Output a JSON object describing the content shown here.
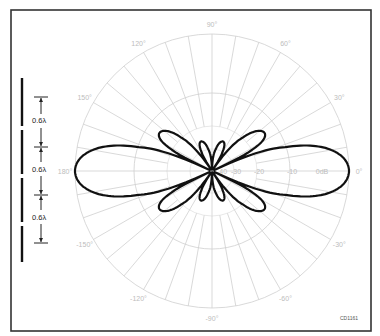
{
  "figure": {
    "code": "CD1161"
  },
  "array": {
    "element_count": 4,
    "spacing_labels": [
      "0.6λ",
      "0.6λ",
      "0.6λ"
    ]
  },
  "polar_grid": {
    "angle_labels": [
      {
        "angle": 90,
        "text": "90°"
      },
      {
        "angle": 60,
        "text": "60°"
      },
      {
        "angle": 30,
        "text": "30°"
      },
      {
        "angle": 0,
        "text": "0°"
      },
      {
        "angle": -30,
        "text": "-30°"
      },
      {
        "angle": -60,
        "text": "-60°"
      },
      {
        "angle": -90,
        "text": "-90°"
      },
      {
        "angle": -120,
        "text": "-120°"
      },
      {
        "angle": -150,
        "text": "-150°"
      },
      {
        "angle": 180,
        "text": "180°"
      },
      {
        "angle": 150,
        "text": "150°"
      },
      {
        "angle": 120,
        "text": "120°"
      }
    ],
    "db_labels": [
      "-40",
      "-30",
      "-20",
      "-10",
      "0dB"
    ],
    "radial_spacing_deg": 10,
    "ring_colors": "#cfcfcf"
  },
  "chart_data": {
    "type": "polar",
    "title": "",
    "radial_unit": "dB",
    "radial_ticks": [
      -40,
      -30,
      -20,
      -10,
      0
    ],
    "angular_ticks_deg": [
      0,
      30,
      60,
      90,
      120,
      150,
      180,
      -150,
      -120,
      -90,
      -60,
      -30
    ],
    "series": [
      {
        "name": "radiation pattern",
        "description": "Main broadside lobes at 0° and 180° (0 dB); side lobes near ±25°/±155° (~-5 dB) and ±70°/±110° (~-8 dB); nulls between",
        "lobes": [
          {
            "direction_deg": 0,
            "peak_db": 0
          },
          {
            "direction_deg": 180,
            "peak_db": 0
          },
          {
            "direction_deg": 28,
            "peak_db": -5
          },
          {
            "direction_deg": -28,
            "peak_db": -5
          },
          {
            "direction_deg": 152,
            "peak_db": -5
          },
          {
            "direction_deg": -152,
            "peak_db": -5
          },
          {
            "direction_deg": 72,
            "peak_db": -8
          },
          {
            "direction_deg": -72,
            "peak_db": -8
          },
          {
            "direction_deg": 108,
            "peak_db": -8
          },
          {
            "direction_deg": -108,
            "peak_db": -8
          }
        ]
      }
    ]
  }
}
